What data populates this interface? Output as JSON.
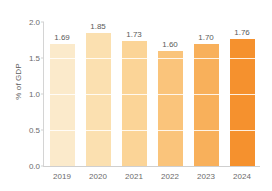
{
  "chart_data": {
    "type": "bar",
    "title": "",
    "subtitle": "",
    "xlabel": "",
    "ylabel": "% of GDP",
    "categories": [
      "2019",
      "2020",
      "2021",
      "2022",
      "2023",
      "2024"
    ],
    "values": [
      1.69,
      1.85,
      1.73,
      1.6,
      1.7,
      1.76
    ],
    "value_labels": [
      "1.69",
      "1.85",
      "1.73",
      "1.60",
      "1.70",
      "1.76"
    ],
    "ylim": [
      0.0,
      2.0
    ],
    "ytick_labels": [
      "0.0",
      "0.5",
      "1.0",
      "1.5",
      "2.0"
    ],
    "ytick_values": [
      0.0,
      0.5,
      1.0,
      1.5,
      2.0
    ],
    "grid": true,
    "grid_orientation": "horizontal",
    "legend": false,
    "legend_position": "none",
    "bar_colors": [
      "#FBEACB",
      "#FBE0B0",
      "#FBD497",
      "#FAC47B",
      "#F8B05B",
      "#F5912E"
    ],
    "axis_color": "#D2D2D2",
    "label_color": "#5A5A5A",
    "tick_color": "#6B6B6B",
    "gridline_color": "#FFFFFF",
    "background": "#FFFFFF"
  }
}
